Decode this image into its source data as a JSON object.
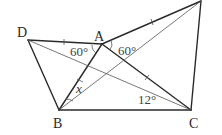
{
  "diagram": {
    "points": {
      "A": {
        "label": "A",
        "x": 102,
        "y": 44
      },
      "B": {
        "label": "B",
        "x": 59,
        "y": 110
      },
      "C": {
        "label": "C",
        "x": 191,
        "y": 110
      },
      "D": {
        "label": "D",
        "x": 28,
        "y": 40
      },
      "E": {
        "label": "",
        "x": 201,
        "y": 1
      }
    },
    "angle_labels": {
      "left_60": "60°",
      "right_60": "60°",
      "angle_12": "12°",
      "unknown_x": "x"
    }
  }
}
